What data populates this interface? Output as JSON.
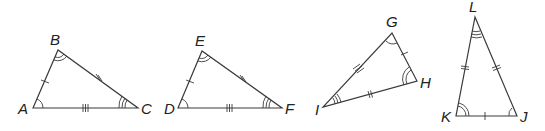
{
  "figure": {
    "triangles": [
      {
        "name": "ABC",
        "vertices": {
          "A": {
            "label": "A",
            "x": 33,
            "y": 108,
            "angle_arcs": 1
          },
          "B": {
            "label": "B",
            "x": 58,
            "y": 50,
            "angle_arcs": 2
          },
          "C": {
            "label": "C",
            "x": 138,
            "y": 108,
            "angle_arcs": 3
          }
        },
        "sides": {
          "AB": 1,
          "BC": 2,
          "AC": 3
        }
      },
      {
        "name": "DEF",
        "vertices": {
          "D": {
            "label": "D",
            "x": 178,
            "y": 108,
            "angle_arcs": 1
          },
          "E": {
            "label": "E",
            "x": 202,
            "y": 51,
            "angle_arcs": 2
          },
          "F": {
            "label": "F",
            "x": 282,
            "y": 108,
            "angle_arcs": 3
          }
        },
        "sides": {
          "DE": 1,
          "EF": 2,
          "DF": 3
        }
      },
      {
        "name": "GHI",
        "vertices": {
          "G": {
            "label": "G",
            "x": 392,
            "y": 33,
            "angle_arcs": 1
          },
          "H": {
            "label": "H",
            "x": 417,
            "y": 81,
            "angle_arcs": 2
          },
          "I": {
            "label": "I",
            "x": 323,
            "y": 107,
            "angle_arcs": 3
          }
        },
        "sides": {
          "GH": 1,
          "HI": 2,
          "GI": 3
        }
      },
      {
        "name": "JKL",
        "vertices": {
          "J": {
            "label": "J",
            "x": 517,
            "y": 116,
            "angle_arcs": 1
          },
          "K": {
            "label": "K",
            "x": 456,
            "y": 116,
            "angle_arcs": 2
          },
          "L": {
            "label": "L",
            "x": 475,
            "y": 17,
            "angle_arcs": 3
          }
        },
        "sides": {
          "JK": 1,
          "KL": 2,
          "JL": 2
        }
      }
    ]
  },
  "labels": {
    "A": "A",
    "B": "B",
    "C": "C",
    "D": "D",
    "E": "E",
    "F": "F",
    "G": "G",
    "H": "H",
    "I": "I",
    "J": "J",
    "K": "K",
    "L": "L"
  }
}
